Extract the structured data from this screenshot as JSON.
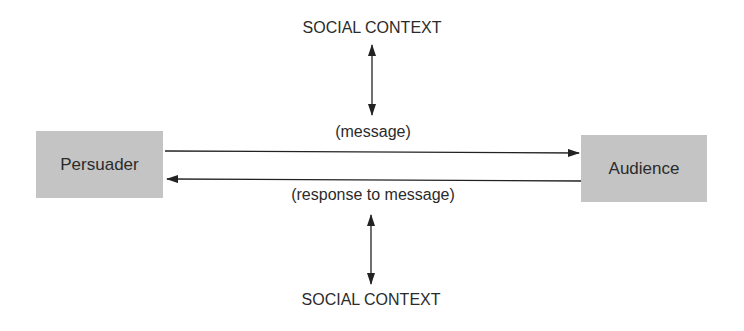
{
  "diagram": {
    "nodes": {
      "persuader": {
        "label": "Persuader"
      },
      "audience": {
        "label": "Audience"
      }
    },
    "context_top": {
      "label": "SOCIAL CONTEXT"
    },
    "context_bottom": {
      "label": "SOCIAL CONTEXT"
    },
    "edges": {
      "message": {
        "label": "(message)",
        "from": "Persuader",
        "to": "Audience"
      },
      "response": {
        "label": "(response to message)",
        "from": "Audience",
        "to": "Persuader"
      }
    },
    "colors": {
      "box_fill": "#c4c4c4",
      "line": "#222222",
      "text": "#2b2b2b"
    }
  }
}
